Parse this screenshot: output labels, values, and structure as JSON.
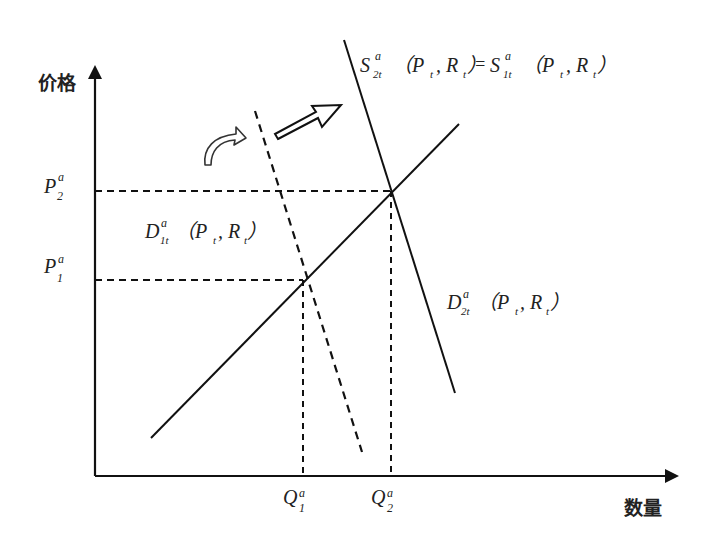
{
  "diagram": {
    "type": "supply-demand",
    "y_axis_label": "价格",
    "x_axis_label": "数量",
    "price_ticks": [
      {
        "label": "P",
        "sup": "a",
        "sub": "2",
        "y": 191
      },
      {
        "label": "P",
        "sup": "a",
        "sub": "1",
        "y": 280
      }
    ],
    "quantity_ticks": [
      {
        "label": "Q",
        "sup": "a",
        "sub": "1",
        "x": 303
      },
      {
        "label": "Q",
        "sup": "a",
        "sub": "2",
        "x": 391
      }
    ],
    "curves": [
      {
        "name": "supply",
        "label_main": "S",
        "label_sup": "a",
        "label_sub": "2t",
        "args": "(P",
        "args_sub": "t",
        "args2": ", R",
        "args2_sub": "t",
        "args_close": ")",
        "equals": "=",
        "label2_main": "S",
        "label2_sup": "a",
        "label2_sub": "1t",
        "style": "solid"
      },
      {
        "name": "demand-1",
        "label_main": "D",
        "label_sup": "a",
        "label_sub": "1t",
        "style": "dashed"
      },
      {
        "name": "demand-2",
        "label_main": "D",
        "label_sup": "a",
        "label_sub": "2t",
        "style": "solid"
      }
    ],
    "args": {
      "open": "（P",
      "sub_t": "t",
      "comma": ", R",
      "close": "）"
    },
    "shift_arrows": [
      "curved-shift-arrow",
      "outlined-shift-arrow"
    ],
    "colors": {
      "line": "#111111",
      "text": "#222222",
      "background": "#ffffff"
    }
  }
}
